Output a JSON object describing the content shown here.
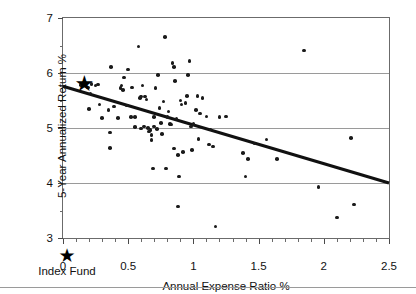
{
  "chart_data": {
    "type": "scatter",
    "title": "",
    "xlabel": "Annual Expense Ratio %",
    "ylabel": "5-Year Annualized Return %",
    "xlim": [
      0,
      2.5
    ],
    "ylim": [
      3,
      7
    ],
    "grid": true,
    "legend_position": "bottom-left",
    "x_ticks": [
      0,
      0.5,
      1,
      1.5,
      2,
      2.5
    ],
    "x_tick_labels": [
      "0",
      "0.5",
      "1",
      "1.5",
      "2",
      "2.5"
    ],
    "x_minor_ticks": [
      0.1,
      0.2,
      0.3,
      0.4,
      0.6,
      0.7,
      0.8,
      0.9,
      1.1,
      1.2,
      1.3,
      1.4,
      1.6,
      1.7,
      1.8,
      1.9,
      2.1,
      2.2,
      2.3,
      2.4
    ],
    "y_ticks": [
      3,
      4,
      5,
      6,
      7
    ],
    "y_tick_labels": [
      "3",
      "4",
      "5",
      "6",
      "7"
    ],
    "y_minor_ticks": [
      3.5,
      4.5,
      5.5,
      6.5
    ],
    "series": [
      {
        "name": "Mutual Funds",
        "marker": "circle",
        "color": "#1a1a1a",
        "points": [
          [
            0.14,
            5.78
          ],
          [
            0.17,
            5.8
          ],
          [
            0.19,
            5.74
          ],
          [
            0.22,
            5.8
          ],
          [
            0.21,
            5.63
          ],
          [
            0.25,
            5.77
          ],
          [
            0.27,
            5.79
          ],
          [
            0.2,
            5.35
          ],
          [
            0.28,
            5.43
          ],
          [
            0.3,
            5.18
          ],
          [
            0.35,
            5.33
          ],
          [
            0.37,
            6.11
          ],
          [
            0.36,
            4.92
          ],
          [
            0.36,
            4.64
          ],
          [
            0.39,
            5.39
          ],
          [
            0.42,
            5.18
          ],
          [
            0.44,
            5.73
          ],
          [
            0.45,
            5.77
          ],
          [
            0.46,
            5.69
          ],
          [
            0.47,
            5.92
          ],
          [
            0.5,
            6.06
          ],
          [
            0.49,
            5.41
          ],
          [
            0.52,
            5.2
          ],
          [
            0.53,
            5.74
          ],
          [
            0.55,
            5.2
          ],
          [
            0.55,
            5.02
          ],
          [
            0.58,
            6.48
          ],
          [
            0.59,
            5.55
          ],
          [
            0.6,
            5.57
          ],
          [
            0.61,
            5.77
          ],
          [
            0.6,
            4.99
          ],
          [
            0.62,
            5.03
          ],
          [
            0.63,
            5.57
          ],
          [
            0.64,
            5.52
          ],
          [
            0.65,
            5.0
          ],
          [
            0.66,
            4.94
          ],
          [
            0.67,
            4.96
          ],
          [
            0.68,
            4.87
          ],
          [
            0.68,
            4.78
          ],
          [
            0.69,
            4.26
          ],
          [
            0.7,
            5.2
          ],
          [
            0.71,
            5.73
          ],
          [
            0.7,
            5.03
          ],
          [
            0.72,
            4.98
          ],
          [
            0.73,
            5.96
          ],
          [
            0.74,
            5.36
          ],
          [
            0.75,
            5.09
          ],
          [
            0.76,
            4.89
          ],
          [
            0.77,
            5.48
          ],
          [
            0.78,
            6.65
          ],
          [
            0.79,
            4.26
          ],
          [
            0.8,
            5.2
          ],
          [
            0.81,
            5.3
          ],
          [
            0.82,
            5.07
          ],
          [
            0.83,
            5.06
          ],
          [
            0.84,
            6.18
          ],
          [
            0.85,
            6.11
          ],
          [
            0.85,
            4.63
          ],
          [
            0.86,
            5.85
          ],
          [
            0.87,
            5.17
          ],
          [
            0.88,
            4.51
          ],
          [
            0.88,
            3.57
          ],
          [
            0.89,
            4.12
          ],
          [
            0.9,
            5.5
          ],
          [
            0.91,
            5.43
          ],
          [
            0.92,
            4.56
          ],
          [
            0.94,
            5.45
          ],
          [
            0.95,
            5.58
          ],
          [
            0.96,
            5.96
          ],
          [
            0.97,
            6.22
          ],
          [
            0.98,
            5.03
          ],
          [
            0.99,
            4.6
          ],
          [
            1.0,
            5.07
          ],
          [
            1.02,
            5.33
          ],
          [
            1.03,
            5.58
          ],
          [
            1.04,
            4.8
          ],
          [
            1.05,
            5.26
          ],
          [
            1.07,
            5.55
          ],
          [
            1.1,
            5.21
          ],
          [
            1.12,
            4.7
          ],
          [
            1.13,
            4.97
          ],
          [
            1.15,
            4.66
          ],
          [
            1.17,
            3.21
          ],
          [
            1.2,
            5.2
          ],
          [
            1.25,
            5.21
          ],
          [
            1.38,
            4.55
          ],
          [
            1.4,
            4.12
          ],
          [
            1.42,
            4.44
          ],
          [
            1.47,
            4.72
          ],
          [
            1.56,
            4.79
          ],
          [
            1.64,
            4.44
          ],
          [
            1.85,
            6.41
          ],
          [
            1.96,
            3.93
          ],
          [
            2.1,
            3.37
          ],
          [
            2.21,
            4.82
          ],
          [
            2.23,
            3.61
          ]
        ]
      },
      {
        "name": "Index Fund",
        "marker": "star",
        "color": "#000000",
        "points": [
          [
            0.15,
            5.8
          ]
        ]
      }
    ],
    "trendline": {
      "x_start": 0,
      "y_start": 5.76,
      "x_end": 2.5,
      "y_end": 4.0,
      "color": "#111111",
      "width": 3
    }
  },
  "legend": {
    "star_glyph": "★",
    "label": "Index Fund"
  }
}
